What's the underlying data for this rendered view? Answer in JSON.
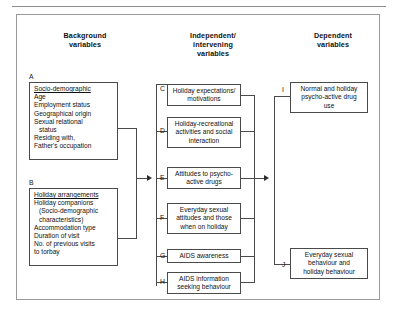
{
  "figure": {
    "columns": [
      {
        "id": "background",
        "heading_line1": "Background",
        "heading_line2": "variables"
      },
      {
        "id": "independent",
        "heading_line1": "Independent/",
        "heading_line2": "intervening",
        "heading_line3": "variables"
      },
      {
        "id": "dependent",
        "heading_line1": "Dependent",
        "heading_line2": "variables"
      }
    ],
    "nodes": {
      "A": {
        "tag": "A",
        "title": "Socio-demographic",
        "items": [
          {
            "text": "Age",
            "indent": 0
          },
          {
            "text": "Employment status",
            "indent": 0
          },
          {
            "text": "Geographical origin",
            "indent": 0
          },
          {
            "text": "Sexual relational",
            "indent": 0
          },
          {
            "text": "status",
            "indent": 1
          },
          {
            "text": "Residing with,",
            "indent": 0
          },
          {
            "text": "Father's occupation",
            "indent": 0
          }
        ]
      },
      "B": {
        "tag": "B",
        "title": "Holiday arrangements",
        "items": [
          {
            "text": "Holiday companions",
            "indent": 0
          },
          {
            "text": "(Socio-demographic",
            "indent": 1
          },
          {
            "text": "characteristics)",
            "indent": 1
          },
          {
            "text": "Accommodation type",
            "indent": 0
          },
          {
            "text": "Duration of visit",
            "indent": 0
          },
          {
            "text": "No. of previous visits",
            "indent": 0
          },
          {
            "text": "to torbay",
            "indent": 0
          }
        ]
      },
      "C": {
        "tag": "C",
        "line1": "Holiday expectations/",
        "line2": "motivations"
      },
      "D": {
        "tag": "D",
        "line1": "Holiday-recreational",
        "line2": "activities and social",
        "line3": "interaction"
      },
      "E": {
        "tag": "E",
        "line1": "Attitudes to psycho-",
        "line2": "active drugs"
      },
      "F": {
        "tag": "F",
        "line1": "Everyday sexual",
        "line2": "attitudes and those",
        "line3": "when on holiday"
      },
      "G": {
        "tag": "G",
        "line1": "AIDS awareness"
      },
      "H": {
        "tag": "H",
        "line1": "AIDS information",
        "line2": "seeking behaviour"
      },
      "I": {
        "tag": "I",
        "line1": "Normal and holiday",
        "line2": "psycho-active drug",
        "line3": "use"
      },
      "J": {
        "tag": "J",
        "line1": "Everyday sexual",
        "line2": "behaviour and",
        "line3": "holiday behaviour"
      }
    },
    "colors": {
      "box_border": "#4a4a4a",
      "frame_border": "#9a9a9a",
      "rule": "#8c8c8c",
      "text": "#111111",
      "connector": "#4a4a4a",
      "arrow": "#2b2b2b",
      "background": "#ffffff"
    }
  }
}
